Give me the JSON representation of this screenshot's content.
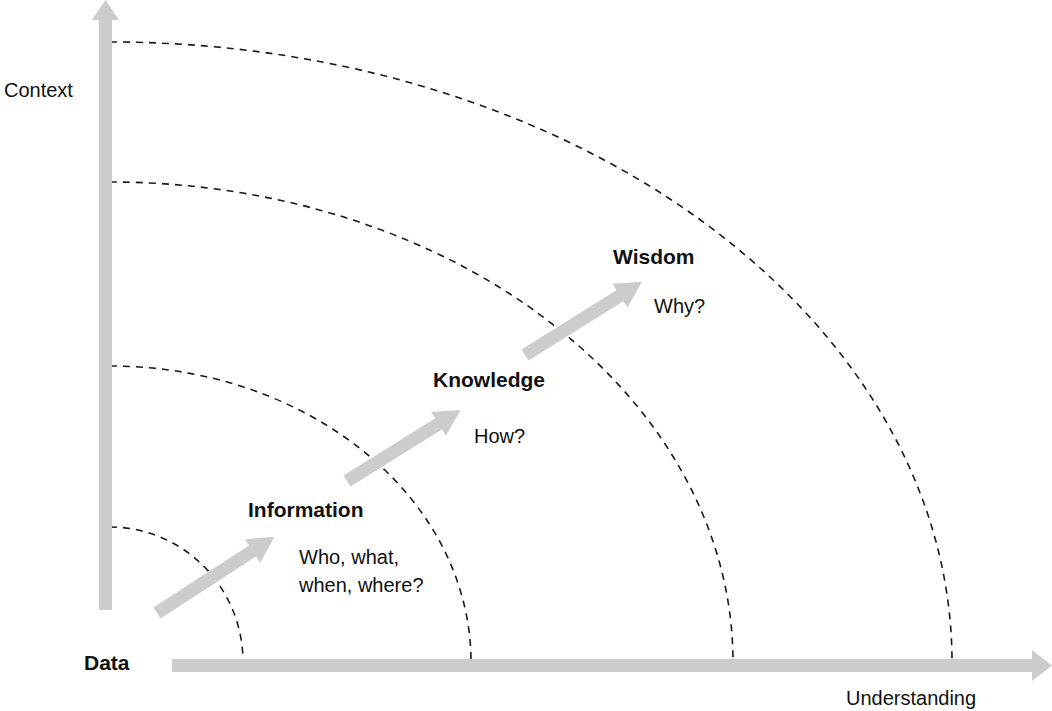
{
  "diagram": {
    "colors": {
      "axis": "#cccccc",
      "arrow": "#cccccc",
      "dashed_arc": "#1a1a1a",
      "text": "#111111",
      "background": "#ffffff"
    },
    "axes": {
      "y_label": "Context",
      "x_label": "Understanding",
      "origin_label": "Data"
    },
    "levels": [
      {
        "name": "Data",
        "question": ""
      },
      {
        "name": "Information",
        "question_line1": "Who, what,",
        "question_line2": "when, where?"
      },
      {
        "name": "Knowledge",
        "question": "How?"
      },
      {
        "name": "Wisdom",
        "question": "Why?"
      }
    ],
    "arcs": [
      {
        "index": 1,
        "rx": 133,
        "ry": 135
      },
      {
        "index": 2,
        "rx": 361,
        "ry": 296
      },
      {
        "index": 3,
        "rx": 623,
        "ry": 480
      },
      {
        "index": 4,
        "rx": 842,
        "ry": 620
      }
    ]
  }
}
